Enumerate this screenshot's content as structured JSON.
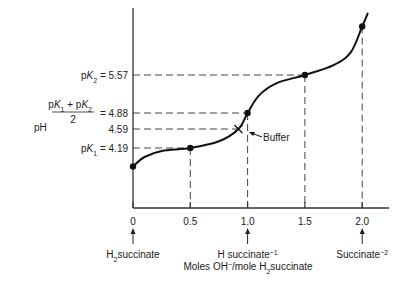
{
  "chart_data": {
    "type": "line",
    "title": "",
    "xlabel": "Moles OH⁻/mole H₂succinate",
    "ylabel": "pH",
    "xlim": [
      0,
      2.2
    ],
    "ylim": [
      3.6,
      6.6
    ],
    "grid": false,
    "x_ticks": [
      0,
      0.5,
      1.0,
      1.5,
      2.0
    ],
    "x_tick_labels": [
      "0",
      "0.5",
      "1.0",
      "1.5",
      "2.0"
    ],
    "curve": {
      "name": "Titration curve of succinic acid",
      "x": [
        0,
        0.1,
        0.25,
        0.5,
        0.75,
        0.92,
        1.0,
        1.1,
        1.25,
        1.5,
        1.75,
        1.9,
        2.0,
        2.05
      ],
      "y": [
        3.8,
        4.0,
        4.13,
        4.19,
        4.33,
        4.59,
        4.88,
        5.2,
        5.42,
        5.57,
        5.75,
        5.98,
        6.45,
        6.7
      ]
    },
    "marked_points": [
      {
        "x": 0,
        "y": 3.8
      },
      {
        "x": 0.5,
        "y": 4.19
      },
      {
        "x": 1.0,
        "y": 4.88
      },
      {
        "x": 1.5,
        "y": 5.57
      },
      {
        "x": 2.0,
        "y": 6.45
      }
    ],
    "buffer_point": {
      "x": 0.92,
      "y": 4.59,
      "label": "Buffer"
    },
    "y_reference_lines": [
      {
        "value": 5.57,
        "label_prefix": "pK",
        "label_sub": "a2",
        "label_suffix": " = 5.57",
        "x_end": 1.5
      },
      {
        "value": 4.88,
        "label_fraction": true,
        "num_a": "pK",
        "num_a_sub": "a1",
        "num_b": " + pK",
        "num_b_sub": "a2",
        "den": "2",
        "label_suffix": "= 4.88",
        "x_end": 1.0
      },
      {
        "value": 4.59,
        "label": "4.59",
        "x_end": 0.92
      },
      {
        "value": 4.19,
        "label_prefix": "pK",
        "label_sub": "a1",
        "label_suffix": " = 4.19",
        "x_end": 0.5
      }
    ],
    "x_reference_lines": [
      0.5,
      1.0,
      1.5,
      2.0
    ],
    "species_annotations": [
      {
        "x": 0,
        "main": "H",
        "sub": "2",
        "rest": "succinate"
      },
      {
        "x": 1.0,
        "main": "H succinate",
        "sup": "−1"
      },
      {
        "x": 2.0,
        "main": "Succinate",
        "sup": "−2"
      }
    ],
    "xlabel_parts": {
      "a": "Moles OH",
      "a_sup": "−",
      "b": "/mole H",
      "b_sub": "2",
      "c": "succinate"
    },
    "ylabel_text": "pH"
  }
}
